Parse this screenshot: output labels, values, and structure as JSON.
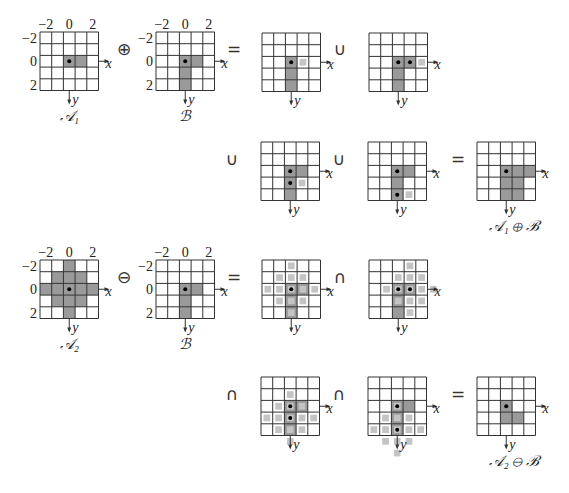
{
  "figure": {
    "cell_px": 11.7,
    "colors": {
      "grid_line": "#333333",
      "set_fill": "#9a9a9a",
      "shifted_fill": "#c4c4c4",
      "origin_dot": "#000000"
    },
    "axis_labels": {
      "x": "x",
      "y": "y"
    },
    "tick_labels": {
      "cols": [
        "−2",
        "0",
        "2"
      ],
      "rows": [
        "−2",
        "0",
        "2"
      ]
    },
    "operators": {
      "dilate": "⊕",
      "erode": "⊖",
      "equals": "=",
      "union": "∪",
      "intersect": "∩"
    },
    "captions": {
      "A1": "𝒜₁",
      "B": "ℬ",
      "A2": "𝒜₂",
      "dilation_result": "𝒜₁ ⊕ ℬ",
      "erosion_result": "𝒜₂ ⊖ ℬ"
    },
    "grids": [
      {
        "id": "A1",
        "x": 40,
        "y": 32,
        "ticks": true,
        "caption": "A1",
        "dark": [
          [
            0,
            0
          ],
          [
            1,
            0
          ]
        ],
        "light": [],
        "dots": [
          [
            0,
            0
          ]
        ]
      },
      {
        "id": "B1",
        "x": 156,
        "y": 32,
        "ticks": true,
        "caption": "B",
        "dark": [
          [
            0,
            0
          ],
          [
            1,
            0
          ],
          [
            0,
            1
          ],
          [
            0,
            2
          ]
        ],
        "light": [],
        "dots": [
          [
            0,
            0
          ]
        ]
      },
      {
        "id": "D1",
        "x": 262,
        "y": 33,
        "dark": [
          [
            0,
            0
          ],
          [
            0,
            1
          ],
          [
            0,
            2
          ]
        ],
        "light": [
          [
            1,
            0
          ]
        ],
        "dots": [
          [
            0,
            0
          ]
        ]
      },
      {
        "id": "D2",
        "x": 369,
        "y": 33,
        "dark": [
          [
            0,
            0
          ],
          [
            1,
            0
          ],
          [
            0,
            1
          ],
          [
            0,
            2
          ]
        ],
        "light": [
          [
            2,
            0
          ]
        ],
        "dots": [
          [
            0,
            0
          ],
          [
            1,
            0
          ]
        ]
      },
      {
        "id": "D3",
        "x": 261,
        "y": 142,
        "dark": [
          [
            0,
            0
          ],
          [
            1,
            0
          ],
          [
            0,
            1
          ],
          [
            0,
            2
          ]
        ],
        "light": [
          [
            1,
            1
          ]
        ],
        "dots": [
          [
            0,
            0
          ],
          [
            0,
            1
          ]
        ]
      },
      {
        "id": "D4",
        "x": 368,
        "y": 142,
        "dark": [
          [
            0,
            0
          ],
          [
            1,
            0
          ],
          [
            0,
            1
          ],
          [
            0,
            2
          ]
        ],
        "light": [
          [
            1,
            2
          ]
        ],
        "dots": [
          [
            0,
            0
          ],
          [
            0,
            2
          ]
        ]
      },
      {
        "id": "DR",
        "x": 477,
        "y": 142,
        "caption": "dilation_result",
        "dark": [
          [
            0,
            0
          ],
          [
            1,
            0
          ],
          [
            2,
            0
          ],
          [
            0,
            1
          ],
          [
            1,
            1
          ],
          [
            0,
            2
          ],
          [
            1,
            2
          ]
        ],
        "light": [],
        "dots": [
          [
            0,
            0
          ]
        ]
      },
      {
        "id": "A2",
        "x": 40,
        "y": 260,
        "ticks": true,
        "caption": "A2",
        "dark": [
          [
            0,
            -2
          ],
          [
            -1,
            -1
          ],
          [
            0,
            -1
          ],
          [
            1,
            -1
          ],
          [
            -2,
            0
          ],
          [
            -1,
            0
          ],
          [
            0,
            0
          ],
          [
            1,
            0
          ],
          [
            2,
            0
          ],
          [
            -1,
            1
          ],
          [
            0,
            1
          ],
          [
            1,
            1
          ],
          [
            0,
            2
          ]
        ],
        "light": [],
        "dots": [
          [
            0,
            0
          ]
        ]
      },
      {
        "id": "B2",
        "x": 156,
        "y": 260,
        "ticks": true,
        "caption": "B",
        "dark": [
          [
            0,
            0
          ],
          [
            1,
            0
          ],
          [
            0,
            1
          ],
          [
            0,
            2
          ]
        ],
        "light": [],
        "dots": [
          [
            0,
            0
          ]
        ]
      },
      {
        "id": "E1",
        "x": 262,
        "y": 260,
        "dark": [
          [
            0,
            0
          ],
          [
            1,
            0
          ],
          [
            0,
            1
          ],
          [
            0,
            2
          ]
        ],
        "light": [
          [
            0,
            -2
          ],
          [
            -1,
            -1
          ],
          [
            0,
            -1
          ],
          [
            1,
            -1
          ],
          [
            -2,
            0
          ],
          [
            -1,
            0
          ],
          [
            0,
            0
          ],
          [
            1,
            0
          ],
          [
            2,
            0
          ],
          [
            -1,
            1
          ],
          [
            0,
            1
          ],
          [
            1,
            1
          ],
          [
            0,
            2
          ]
        ],
        "dots": [
          [
            0,
            0
          ]
        ]
      },
      {
        "id": "E2",
        "x": 369,
        "y": 260,
        "dark": [
          [
            0,
            0
          ],
          [
            1,
            0
          ],
          [
            0,
            1
          ],
          [
            0,
            2
          ]
        ],
        "light": [
          [
            1,
            -2
          ],
          [
            0,
            -1
          ],
          [
            1,
            -1
          ],
          [
            2,
            -1
          ],
          [
            -1,
            0
          ],
          [
            0,
            0
          ],
          [
            1,
            0
          ],
          [
            2,
            0
          ],
          [
            3,
            0
          ],
          [
            0,
            1
          ],
          [
            1,
            1
          ],
          [
            2,
            1
          ],
          [
            1,
            2
          ]
        ],
        "dots": [
          [
            0,
            0
          ],
          [
            1,
            0
          ]
        ]
      },
      {
        "id": "E3",
        "x": 261,
        "y": 377,
        "dark": [
          [
            0,
            0
          ],
          [
            1,
            0
          ],
          [
            0,
            1
          ],
          [
            0,
            2
          ]
        ],
        "light": [
          [
            0,
            -1
          ],
          [
            -1,
            0
          ],
          [
            0,
            0
          ],
          [
            1,
            0
          ],
          [
            -2,
            1
          ],
          [
            -1,
            1
          ],
          [
            0,
            1
          ],
          [
            1,
            1
          ],
          [
            2,
            1
          ],
          [
            -1,
            2
          ],
          [
            0,
            2
          ],
          [
            1,
            2
          ],
          [
            0,
            3
          ]
        ],
        "dots": [
          [
            0,
            0
          ],
          [
            0,
            1
          ]
        ]
      },
      {
        "id": "E4",
        "x": 368,
        "y": 377,
        "dark": [
          [
            0,
            0
          ],
          [
            1,
            0
          ],
          [
            0,
            1
          ],
          [
            0,
            2
          ]
        ],
        "light": [
          [
            0,
            0
          ],
          [
            -1,
            1
          ],
          [
            0,
            1
          ],
          [
            1,
            1
          ],
          [
            -2,
            2
          ],
          [
            -1,
            2
          ],
          [
            0,
            2
          ],
          [
            1,
            2
          ],
          [
            2,
            2
          ],
          [
            -1,
            3
          ],
          [
            0,
            3
          ],
          [
            1,
            3
          ],
          [
            0,
            4
          ]
        ],
        "dots": [
          [
            0,
            0
          ],
          [
            0,
            2
          ]
        ]
      },
      {
        "id": "ER",
        "x": 477,
        "y": 377,
        "caption": "erosion_result",
        "dark": [
          [
            0,
            0
          ],
          [
            0,
            1
          ],
          [
            1,
            1
          ]
        ],
        "light": [],
        "dots": [
          [
            0,
            0
          ]
        ]
      }
    ],
    "operator_positions": [
      {
        "key": "dilate",
        "x": 118,
        "y": 41
      },
      {
        "key": "equals",
        "x": 228,
        "y": 41
      },
      {
        "key": "union",
        "x": 334,
        "y": 41
      },
      {
        "key": "union",
        "x": 226,
        "y": 151
      },
      {
        "key": "union",
        "x": 333,
        "y": 151
      },
      {
        "key": "equals",
        "x": 452,
        "y": 151
      },
      {
        "key": "erode",
        "x": 118,
        "y": 269
      },
      {
        "key": "equals",
        "x": 228,
        "y": 269
      },
      {
        "key": "intersect",
        "x": 334,
        "y": 269
      },
      {
        "key": "intersect",
        "x": 226,
        "y": 386
      },
      {
        "key": "intersect",
        "x": 333,
        "y": 386
      },
      {
        "key": "equals",
        "x": 452,
        "y": 386
      }
    ]
  }
}
